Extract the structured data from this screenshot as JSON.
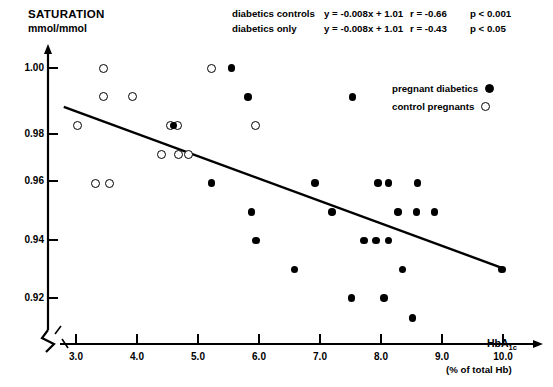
{
  "title": {
    "main": "SATURATION",
    "unit": "mmol/mmol"
  },
  "stats": {
    "rows": [
      {
        "group": "diabetics   controls",
        "equation": "y = -0.008x + 1.01",
        "r": "r = -0.66",
        "p": "p < 0.001"
      },
      {
        "group": "diabetics only",
        "equation": "y = -0.008x + 1.01",
        "r": "r = -0.43",
        "p": "p < 0.05"
      }
    ]
  },
  "legend": {
    "items": [
      {
        "label": "pregnant diabetics",
        "marker": "filled-circle-icon"
      },
      {
        "label": "control pregnants",
        "marker": "open-circle-icon"
      }
    ]
  },
  "axes": {
    "y": {
      "label": "SATURATION mmol/mmol",
      "ticks": [
        "1.00",
        "0.98",
        "0.96",
        "0.94",
        "0.92"
      ],
      "broken": true
    },
    "x": {
      "label": "HbA",
      "label_sub": "1c",
      "sublabel": "(% of total Hb)",
      "ticks": [
        "3.0",
        "4.0",
        "5.0",
        "6.0",
        "7.0",
        "8.0",
        "9.0",
        "10.0"
      ]
    }
  },
  "chart_data": {
    "type": "scatter",
    "xlabel": "HbA1c (% of total Hb)",
    "ylabel": "SATURATION mmol/mmol",
    "xlim": [
      2.7,
      10.3
    ],
    "ylim": [
      0.908,
      1.008
    ],
    "grid": false,
    "legend_position": "top-right",
    "series": [
      {
        "name": "control pregnants",
        "marker": "open-circle",
        "points": [
          [
            3.45,
            1.0
          ],
          [
            5.22,
            1.0
          ],
          [
            3.45,
            0.99
          ],
          [
            3.92,
            0.99
          ],
          [
            3.02,
            0.98
          ],
          [
            4.55,
            0.98
          ],
          [
            4.66,
            0.98
          ],
          [
            5.95,
            0.98
          ],
          [
            4.4,
            0.97
          ],
          [
            4.68,
            0.97
          ],
          [
            4.85,
            0.97
          ],
          [
            3.32,
            0.96
          ],
          [
            3.55,
            0.96
          ]
        ]
      },
      {
        "name": "pregnant diabetics",
        "marker": "filled-circle",
        "points": [
          [
            5.55,
            1.0
          ],
          [
            5.82,
            0.99
          ],
          [
            7.53,
            0.99
          ],
          [
            4.6,
            0.98
          ],
          [
            5.22,
            0.96
          ],
          [
            6.92,
            0.96
          ],
          [
            7.95,
            0.96
          ],
          [
            8.12,
            0.96
          ],
          [
            8.6,
            0.96
          ],
          [
            5.88,
            0.95
          ],
          [
            7.2,
            0.95
          ],
          [
            8.28,
            0.95
          ],
          [
            8.58,
            0.95
          ],
          [
            8.88,
            0.95
          ],
          [
            5.95,
            0.94
          ],
          [
            7.72,
            0.94
          ],
          [
            7.92,
            0.94
          ],
          [
            8.12,
            0.94
          ],
          [
            6.58,
            0.93
          ],
          [
            8.35,
            0.93
          ],
          [
            9.98,
            0.93
          ],
          [
            7.52,
            0.92
          ],
          [
            8.05,
            0.92
          ],
          [
            8.52,
            0.913
          ]
        ]
      }
    ],
    "regression_lines": [
      {
        "name": "diabetics + controls",
        "equation": "y = -0.008x + 1.01",
        "r": -0.66,
        "p": "< 0.001",
        "x_start": 2.8,
        "y_start": 0.9865,
        "x_end": 9.98,
        "y_end": 0.9305
      },
      {
        "name": "diabetics only",
        "equation": "y = -0.008x + 1.01",
        "r": -0.43,
        "p": "< 0.05"
      }
    ]
  }
}
